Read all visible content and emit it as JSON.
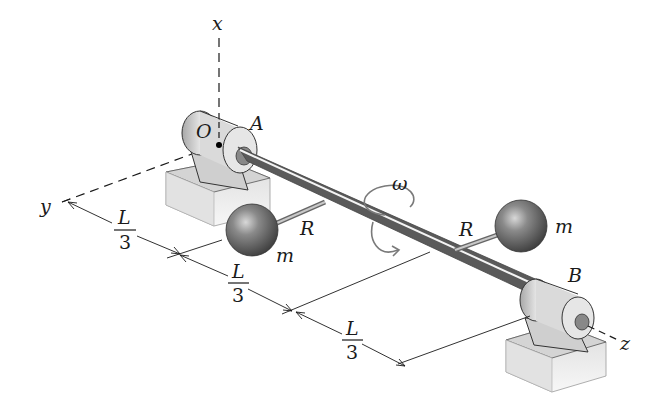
{
  "diagram": {
    "type": "rotating shaft with two masses",
    "axes": {
      "x": "x",
      "y": "y",
      "z": "z"
    },
    "points": {
      "origin": "O",
      "bearing_left": "A",
      "bearing_right": "B"
    },
    "masses": [
      {
        "label": "m",
        "arm_label": "R",
        "position": "first third"
      },
      {
        "label": "m",
        "arm_label": "R",
        "position": "second third"
      }
    ],
    "angular_velocity": "ω",
    "dimensions": [
      {
        "numerator": "L",
        "denominator": "3"
      },
      {
        "numerator": "L",
        "denominator": "3"
      },
      {
        "numerator": "L",
        "denominator": "3"
      }
    ],
    "colors": {
      "line": "#1a1a1a",
      "bearing_light": "#e6e6e6",
      "bearing_dark": "#9a9a9a",
      "sphere": "#6a6a6a",
      "omega_arrow": "#7a7a7a"
    }
  }
}
